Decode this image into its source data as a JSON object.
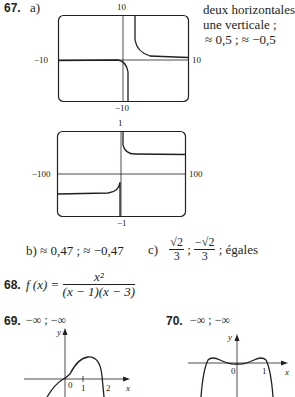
{
  "ex67": {
    "number": "67.",
    "part_a": "a)",
    "notes": [
      "deux horizontales ;",
      "une verticale ;",
      "≈ 0,5 ; ≈ −0,5"
    ],
    "graph1": {
      "ymax": "10",
      "ymin": "−10",
      "xmin": "−10",
      "xmax": "10"
    },
    "graph2": {
      "ymax": "1",
      "ymin": "−1",
      "xmin": "−100",
      "xmax": "100"
    },
    "part_b": "b)  ≈ 0,47 ; ≈ −0,47",
    "part_c": {
      "label": "c)",
      "frac1_num": "√2",
      "frac1_den": "3",
      "sep1": ";",
      "frac2_num": "−√2",
      "frac2_den": "3",
      "tail": "; égales"
    }
  },
  "ex68": {
    "number": "68.",
    "lhs": "f (x) =",
    "numerator": "x²",
    "denominator": "(x − 1)(x − 3)"
  },
  "ex69": {
    "number": "69.",
    "text": "−∞ ; −∞",
    "axis_y": "y",
    "axis_x": "x",
    "ticks": [
      "0",
      "1",
      "2"
    ]
  },
  "ex70": {
    "number": "70.",
    "text": "−∞ ; −∞",
    "axis_y": "y",
    "axis_x": "x",
    "ticks": [
      "0",
      "1"
    ]
  }
}
